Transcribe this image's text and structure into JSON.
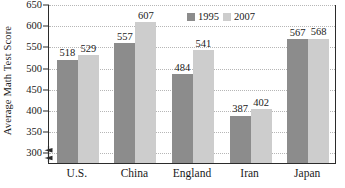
{
  "chart_data": {
    "type": "bar",
    "title": "",
    "xlabel": "",
    "ylabel": "Average Math Test Score",
    "ylim": [
      275,
      650
    ],
    "yticks": [
      300,
      350,
      400,
      450,
      500,
      550,
      600,
      650
    ],
    "grid": true,
    "axis_break": true,
    "legend_position": "top-right-inside",
    "categories": [
      "U.S.",
      "China",
      "England",
      "Iran",
      "Japan"
    ],
    "series": [
      {
        "name": "1995",
        "color": "#8c8c8c",
        "values": [
          518,
          557,
          484,
          387,
          567
        ]
      },
      {
        "name": "2007",
        "color": "#cdcdcd",
        "values": [
          529,
          607,
          541,
          402,
          568
        ]
      }
    ]
  },
  "legend": {
    "entries": [
      {
        "label": "1995"
      },
      {
        "label": "2007"
      }
    ]
  },
  "colors": {
    "series_1995": "#8c8c8c",
    "series_2007": "#cdcdcd",
    "axis": "#2b2b2b",
    "gridline": "#b6b6b6",
    "background": "#ffffff"
  }
}
